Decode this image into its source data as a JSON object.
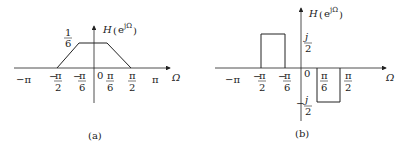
{
  "panels": [
    {
      "id": "a",
      "caption": "(a)",
      "ylabel": "H(e^{jΩ})",
      "ylabel_H": "H",
      "ylabel_e": "e",
      "ylabel_sup": "jΩ",
      "xlabel": "Ω",
      "level_num": "1",
      "level_den": "6",
      "origin": "0",
      "ticks": [
        {
          "sign": "−π",
          "num": "",
          "den": ""
        },
        {
          "sign": "−",
          "num": "π",
          "den": "2"
        },
        {
          "sign": "−",
          "num": "π",
          "den": "6"
        },
        {
          "sign": "",
          "num": "π",
          "den": "6"
        },
        {
          "sign": "",
          "num": "π",
          "den": "2"
        },
        {
          "sign": "π",
          "num": "",
          "den": ""
        }
      ],
      "shape": "trapezoid: 0 at ±π/2, rises to 1/6 at ±π/6"
    },
    {
      "id": "b",
      "caption": "(b)",
      "ylabel": "H(e^{jΩ})",
      "ylabel_H": "H",
      "ylabel_e": "e",
      "ylabel_sup": "jΩ",
      "xlabel": "Ω",
      "pos_num": "j",
      "pos_den": "2",
      "neg_sign": "−",
      "neg_num": "j",
      "neg_den": "2",
      "origin": "0",
      "ticks": [
        {
          "sign": "−π",
          "num": "",
          "den": ""
        },
        {
          "sign": "−",
          "num": "π",
          "den": "2"
        },
        {
          "sign": "−",
          "num": "π",
          "den": "6"
        },
        {
          "sign": "",
          "num": "π",
          "den": "6"
        },
        {
          "sign": "",
          "num": "π",
          "den": "2"
        }
      ],
      "shape": "j/2 on [−π/2, −π/6], −j/2 on [π/6, π/2]"
    }
  ]
}
